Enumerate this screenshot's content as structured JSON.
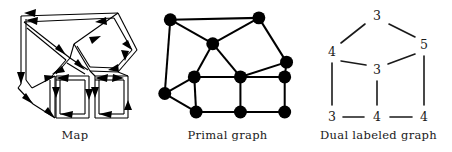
{
  "figure": {
    "width": 452,
    "height": 152,
    "background": "#ffffff",
    "ink": "#000000"
  },
  "panels": [
    {
      "id": "map",
      "caption": "Map"
    },
    {
      "id": "primal",
      "caption": "Primal graph"
    },
    {
      "id": "dual",
      "caption": "Dual labeled graph"
    }
  ],
  "map": {
    "caption": "Map",
    "description": "planar map drawn as doubled outline regions with arrowheads on each border segment",
    "vertices": {
      "tl": [
        18,
        13
      ],
      "tr": [
        122,
        10
      ],
      "c": [
        72,
        56
      ],
      "lm": [
        16,
        86
      ],
      "lb": [
        29,
        104
      ],
      "m1": [
        55,
        74
      ],
      "m2": [
        88,
        71
      ],
      "pr": [
        137,
        52
      ],
      "pb": [
        118,
        73
      ],
      "q1l": [
        56,
        76
      ],
      "q1r": [
        89,
        76
      ],
      "q1bl": [
        56,
        118
      ],
      "q1br": [
        89,
        118
      ],
      "q2l": [
        95,
        76
      ],
      "q2r": [
        128,
        76
      ],
      "q2bl": [
        95,
        118
      ],
      "q2br": [
        128,
        118
      ]
    },
    "regions": [
      {
        "name": "upper-left-triangle",
        "sides": 3
      },
      {
        "name": "left-lower-region",
        "sides": 4
      },
      {
        "name": "pentagon-right",
        "sides": 5
      },
      {
        "name": "middle-triangle",
        "sides": 3
      },
      {
        "name": "square-left",
        "sides": 4
      },
      {
        "name": "square-right",
        "sides": 4
      }
    ]
  },
  "primal": {
    "caption": "Primal graph",
    "node_radius": 6.5,
    "node_color": "#000000",
    "edge_color": "#000000",
    "nodes": [
      {
        "id": "n1",
        "x": 22,
        "y": 16
      },
      {
        "id": "n2",
        "x": 118,
        "y": 14
      },
      {
        "id": "n3",
        "x": 68,
        "y": 42
      },
      {
        "id": "n4",
        "x": 148,
        "y": 62
      },
      {
        "id": "n5",
        "x": 48,
        "y": 78
      },
      {
        "id": "n6",
        "x": 98,
        "y": 78
      },
      {
        "id": "n7",
        "x": 146,
        "y": 78
      },
      {
        "id": "n8",
        "x": 16,
        "y": 96
      },
      {
        "id": "n9",
        "x": 50,
        "y": 116
      },
      {
        "id": "n10",
        "x": 98,
        "y": 116
      },
      {
        "id": "n11",
        "x": 146,
        "y": 116
      }
    ],
    "edges": [
      [
        "n1",
        "n2"
      ],
      [
        "n1",
        "n3"
      ],
      [
        "n1",
        "n8"
      ],
      [
        "n2",
        "n3"
      ],
      [
        "n2",
        "n4"
      ],
      [
        "n3",
        "n5"
      ],
      [
        "n3",
        "n6"
      ],
      [
        "n4",
        "n7"
      ],
      [
        "n4",
        "n6"
      ],
      [
        "n5",
        "n6"
      ],
      [
        "n5",
        "n8"
      ],
      [
        "n5",
        "n9"
      ],
      [
        "n6",
        "n7"
      ],
      [
        "n6",
        "n10"
      ],
      [
        "n7",
        "n11"
      ],
      [
        "n8",
        "n9"
      ],
      [
        "n9",
        "n10"
      ],
      [
        "n10",
        "n11"
      ]
    ]
  },
  "dual": {
    "caption": "Dual labeled graph",
    "edge_color": "#1a1a1a",
    "label_color": "#1a1a1a",
    "nodes": [
      {
        "id": "d_top",
        "label": "3",
        "x": 72,
        "y": 16
      },
      {
        "id": "d_left",
        "label": "4",
        "x": 27,
        "y": 52
      },
      {
        "id": "d_right",
        "label": "5",
        "x": 119,
        "y": 45
      },
      {
        "id": "d_center",
        "label": "3",
        "x": 72,
        "y": 70
      },
      {
        "id": "d_bl",
        "label": "3",
        "x": 27,
        "y": 117
      },
      {
        "id": "d_bc",
        "label": "4",
        "x": 72,
        "y": 117
      },
      {
        "id": "d_br",
        "label": "4",
        "x": 119,
        "y": 117
      }
    ],
    "edges": [
      [
        "d_top",
        "d_left"
      ],
      [
        "d_top",
        "d_right"
      ],
      [
        "d_left",
        "d_center"
      ],
      [
        "d_right",
        "d_center"
      ],
      [
        "d_left",
        "d_bl"
      ],
      [
        "d_center",
        "d_bc"
      ],
      [
        "d_right",
        "d_br"
      ],
      [
        "d_bl",
        "d_bc"
      ],
      [
        "d_bc",
        "d_br"
      ]
    ],
    "labels": [
      "3",
      "4",
      "5",
      "3",
      "3",
      "4",
      "4"
    ]
  }
}
